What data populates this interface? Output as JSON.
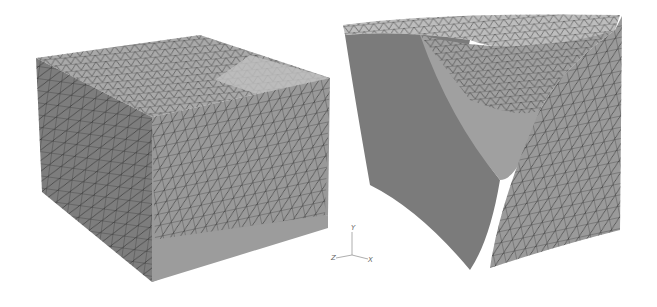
{
  "figure": {
    "colors": {
      "background": "#ffffff",
      "surface_light": "#b5b5b5",
      "surface_mid": "#8f8f8f",
      "surface_dark": "#6e6e6e",
      "mesh": "#2a2a2a"
    },
    "axes": {
      "y_label": "Y",
      "z_label": "Z",
      "x_label": "X"
    }
  }
}
